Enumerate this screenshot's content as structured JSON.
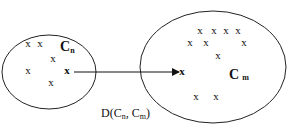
{
  "diagram": {
    "left_cluster": {
      "label": "C",
      "label_sub": "n",
      "points": [
        {
          "x": 28,
          "y": 47,
          "t": "x"
        },
        {
          "x": 40,
          "y": 47,
          "t": "x"
        },
        {
          "x": 53,
          "y": 62,
          "t": "x"
        },
        {
          "x": 28,
          "y": 74,
          "t": "x"
        },
        {
          "x": 67,
          "y": 74,
          "t": "x"
        },
        {
          "x": 51,
          "y": 86,
          "t": "x"
        }
      ]
    },
    "right_cluster": {
      "label": "C",
      "label_sub": "m",
      "points": [
        {
          "x": 200,
          "y": 34,
          "t": "x"
        },
        {
          "x": 214,
          "y": 34,
          "t": "x"
        },
        {
          "x": 226,
          "y": 34,
          "t": "x"
        },
        {
          "x": 238,
          "y": 34,
          "t": "x"
        },
        {
          "x": 190,
          "y": 46,
          "t": "x"
        },
        {
          "x": 206,
          "y": 46,
          "t": "x"
        },
        {
          "x": 244,
          "y": 46,
          "t": "x"
        },
        {
          "x": 218,
          "y": 59,
          "t": "x"
        },
        {
          "x": 182,
          "y": 75,
          "t": "x"
        },
        {
          "x": 196,
          "y": 100,
          "t": "x"
        },
        {
          "x": 216,
          "y": 100,
          "t": "x"
        }
      ]
    },
    "distance_label": "D(C",
    "distance_sub1": "n",
    "distance_mid": ", C",
    "distance_sub2": "m",
    "distance_end": ")"
  }
}
